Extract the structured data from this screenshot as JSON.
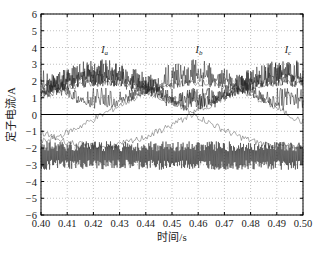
{
  "chart_data": {
    "type": "line",
    "title": "",
    "xlabel": "时间/s",
    "ylabel": "定子电流/A",
    "xlim": [
      0.4,
      0.5
    ],
    "ylim": [
      -6,
      6
    ],
    "x_ticks": [
      "0.40",
      "0.41",
      "0.42",
      "0.43",
      "0.44",
      "0.45",
      "0.46",
      "0.47",
      "0.48",
      "0.49",
      "0.50"
    ],
    "y_ticks": [
      "-6",
      "-5",
      "-4",
      "-3",
      "-2",
      "-1",
      "0",
      "1",
      "2",
      "3",
      "4",
      "5",
      "6"
    ],
    "grid": true,
    "legend": "inline annotations",
    "annotations": [
      {
        "text": "I_a",
        "x": 0.423,
        "y": 3.7
      },
      {
        "text": "I_b",
        "x": 0.459,
        "y": 3.7
      },
      {
        "text": "I_c",
        "x": 0.493,
        "y": 3.7
      }
    ],
    "series": [
      {
        "name": "I_a",
        "amplitude": 3.3,
        "peak_at": 0.423,
        "ripple": 1.5
      },
      {
        "name": "I_b",
        "amplitude": 3.3,
        "peak_at": 0.459,
        "ripple": 1.5
      },
      {
        "name": "I_c",
        "amplitude": 3.3,
        "peak_at": 0.493,
        "ripple": 1.5
      }
    ],
    "envelope_period_s": 0.071,
    "lower_band": {
      "min": -3.3,
      "max": -1.6
    }
  }
}
